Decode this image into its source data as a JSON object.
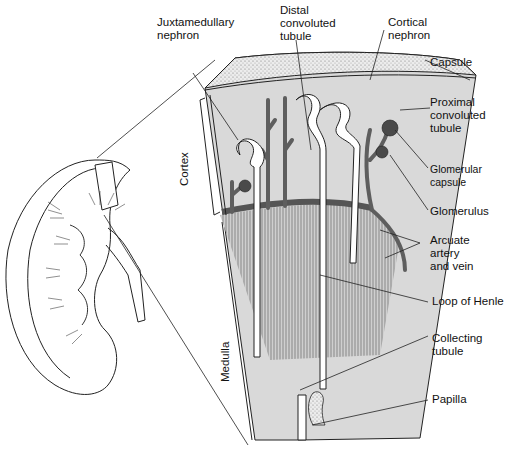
{
  "diagram": {
    "colors": {
      "tissue": "#d9d9d9",
      "vessel": "#6a6a6a",
      "tubule": "#ffffff",
      "capsule_stipple": "#bdbdbd",
      "line": "#111111"
    },
    "labels": {
      "juxtamedullary": "Juxtamedullary\nnephron",
      "distal": "Distal\nconvoluted\ntubule",
      "cortical": "Cortical\nnephron",
      "capsule": "Capsule",
      "proximal": "Proximal\nconvoluted\ntubule",
      "glomerular_capsule": "Glomerular\ncapsule",
      "glomerulus": "Glomerulus",
      "arcuate": "Arcuate\nartery\nand vein",
      "loop_of_henle": "Loop of Henle",
      "collecting": "Collecting\ntubule",
      "papilla": "Papilla"
    },
    "regions": {
      "cortex": "Cortex",
      "medulla": "Medulla"
    }
  }
}
